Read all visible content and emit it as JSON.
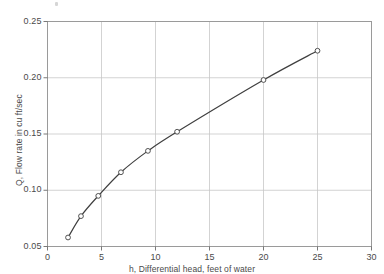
{
  "chart_data": {
    "type": "line",
    "title": "",
    "subtitle": "",
    "xlabel": "h, Differential head, feet of water",
    "ylabel": "Q, Flow rate in cu ft/sec",
    "xlim": [
      0,
      30
    ],
    "ylim": [
      0.05,
      0.25
    ],
    "xticks": [
      0,
      5,
      10,
      15,
      20,
      25,
      30
    ],
    "xtick_labels": [
      "0",
      "5",
      "10",
      "15",
      "20",
      "25",
      "30"
    ],
    "yticks": [
      0.05,
      0.1,
      0.15,
      0.2,
      0.25
    ],
    "ytick_labels": [
      "0.05",
      "0.10",
      "0.15",
      "0.20",
      "0.25"
    ],
    "grid": true,
    "legend": null,
    "marker": "open-circle",
    "line_color": "#3f3f3f",
    "grid_color": "#c8c8c8",
    "frame_color": "#9a9a9a",
    "series": [
      {
        "name": "Q vs h",
        "x": [
          1.9,
          3.1,
          4.7,
          6.8,
          9.3,
          12.0,
          20.0,
          25.0
        ],
        "values": [
          0.058,
          0.077,
          0.095,
          0.116,
          0.135,
          0.152,
          0.198,
          0.224
        ]
      }
    ],
    "annotations": []
  },
  "figure": {
    "background": "#ffffff",
    "scan_speck": true
  }
}
